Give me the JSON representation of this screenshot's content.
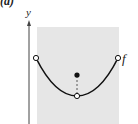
{
  "figure": {
    "caption": "(a)",
    "axis_label_y": "y",
    "function_label": "f",
    "colors": {
      "shade": "#e6e6e6",
      "curve": "#111111",
      "axis": "#444444"
    }
  }
}
